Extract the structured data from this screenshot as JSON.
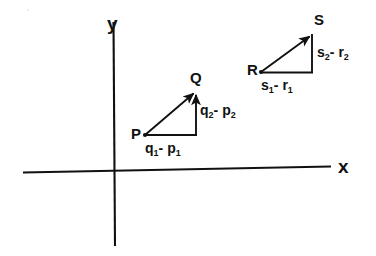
{
  "figure": {
    "background_color": "#ffffff",
    "stroke_color": "#111111"
  },
  "axes": {
    "x_label": "x",
    "y_label": "y",
    "origin_label": ""
  },
  "triangles": [
    {
      "name": "pq-triangle",
      "start_label": "P",
      "end_label": "Q",
      "horizontal_label_base": "q",
      "horizontal_label": "q1- p1",
      "vertical_label": "q2- p2",
      "horizontal_parts": {
        "a": "q",
        "a_sub": "1",
        "op": "- ",
        "b": "p",
        "b_sub": "1"
      },
      "vertical_parts": {
        "a": "q",
        "a_sub": "2",
        "op": "- ",
        "b": "p",
        "b_sub": "2"
      }
    },
    {
      "name": "rs-triangle",
      "start_label": "R",
      "end_label": "S",
      "horizontal_label": "s1- r1",
      "vertical_label": "s2- r2",
      "horizontal_parts": {
        "a": "s",
        "a_sub": "1",
        "op": "- ",
        "b": "r",
        "b_sub": "1"
      },
      "vertical_parts": {
        "a": "s",
        "a_sub": "2",
        "op": "- ",
        "b": "r",
        "b_sub": "2"
      }
    }
  ]
}
